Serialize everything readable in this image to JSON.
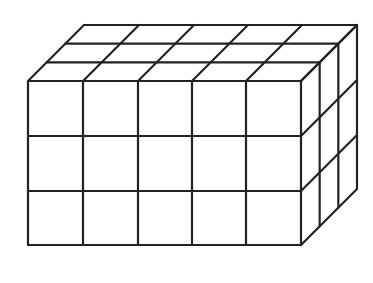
{
  "diagram": {
    "type": "rectangular-prism-unit-cubes",
    "dimensions": {
      "length": 5,
      "height": 3,
      "depth": 3
    },
    "stroke_color": "#222222",
    "background": "#ffffff"
  },
  "geometry": {
    "front_x": [
      28,
      83,
      138,
      192,
      246,
      301
    ],
    "front_y": [
      81,
      136,
      191,
      245
    ],
    "depth_dx": 56,
    "depth_dy": -56
  }
}
